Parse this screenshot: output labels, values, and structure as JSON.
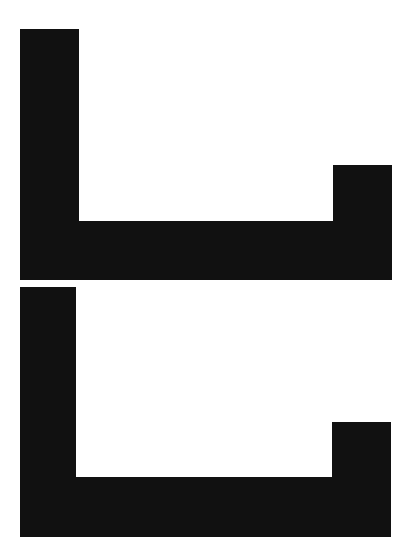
{
  "diagram": {
    "background": "#ffffff",
    "fill": "#111111",
    "shapes": [
      {
        "name": "upper-shape",
        "points": "20,29 79,29 79,221 333,221 333,165 392,165 392,280 20,280"
      },
      {
        "name": "lower-shape",
        "points": "20,287 76,287 76,477 332,477 332,422 391,422 391,537 20,537"
      }
    ]
  }
}
